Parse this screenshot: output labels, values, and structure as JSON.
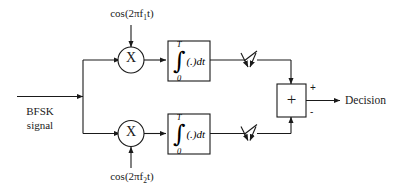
{
  "diagram": {
    "input": {
      "label_line1": "BFSK",
      "label_line2": "signal"
    },
    "branches": [
      {
        "id": "upper",
        "carrier_label": "cos(2πf",
        "carrier_subscript": "1",
        "carrier_tail": "t)",
        "multiplier_symbol": "X",
        "integrator_upper_limit": "T",
        "integrator_lower_limit": "0",
        "integrator_sign": "∫",
        "integrator_body": "(.)dt",
        "sampler_name": "sampler"
      },
      {
        "id": "lower",
        "carrier_label": "cos(2πf",
        "carrier_subscript": "2",
        "carrier_tail": "t)",
        "multiplier_symbol": "X",
        "integrator_upper_limit": "T",
        "integrator_lower_limit": "0",
        "integrator_sign": "∫",
        "integrator_body": "(.)dt",
        "sampler_name": "sampler"
      }
    ],
    "summing_junction": {
      "symbol": "+",
      "positive_sign": "+",
      "negative_sign": "-"
    },
    "output": {
      "label": "Decision"
    },
    "colors": {
      "line": "#1a1a1a",
      "text": "#1a1a1a",
      "background": "#ffffff"
    }
  }
}
